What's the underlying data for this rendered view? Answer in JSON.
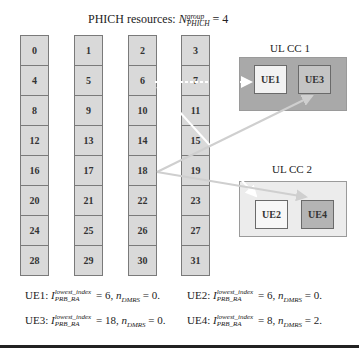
{
  "title": {
    "prefix": "PHICH resources: ",
    "symbol": "N",
    "superscript": "group",
    "subscript": "PHICH",
    "suffix": " = 4"
  },
  "phich_columns": [
    {
      "cells": [
        "0",
        "4",
        "8",
        "12",
        "16",
        "20",
        "24",
        "28"
      ]
    },
    {
      "cells": [
        "1",
        "5",
        "9",
        "13",
        "17",
        "21",
        "25",
        "29"
      ]
    },
    {
      "cells": [
        "2",
        "6",
        "10",
        "14",
        "18",
        "22",
        "26",
        "30"
      ]
    },
    {
      "cells": [
        "3",
        "7",
        "11",
        "15",
        "19",
        "23",
        "27",
        "31"
      ]
    }
  ],
  "carriers": [
    {
      "label": "UL CC 1",
      "ues": [
        {
          "name": "UE1",
          "fill": "#f2f2f2"
        },
        {
          "name": "UE3",
          "fill": "#c4c4c4"
        }
      ],
      "fill": "#a9a9a9"
    },
    {
      "label": "UL CC 2",
      "ues": [
        {
          "name": "UE2",
          "fill": "#f7f7f7"
        },
        {
          "name": "UE4",
          "fill": "#b4b4b4"
        }
      ],
      "fill": "#ececec"
    }
  ],
  "mappings": [
    {
      "from": "6",
      "to": "UE1",
      "color": "#ffffff"
    },
    {
      "from": "6",
      "to": "UE2",
      "color": "#ffffff"
    },
    {
      "from": "18",
      "to": "UE3",
      "color": "#cfcfcf"
    },
    {
      "from": "18",
      "to": "UE4",
      "color": "#cfcfcf"
    }
  ],
  "equations": [
    {
      "ue": "UE1: ",
      "sym": "I",
      "sup": "lowest_index",
      "sub": "PRB_RA",
      "value": " = 6, ",
      "n": "n",
      "nsub": "DMRS",
      "nval": " = 0."
    },
    {
      "ue": "UE2: ",
      "sym": "I",
      "sup": "lowest_index",
      "sub": "PRB_RA",
      "value": " = 6, ",
      "n": "n",
      "nsub": "DMRS",
      "nval": " = 0."
    },
    {
      "ue": "UE3: ",
      "sym": "I",
      "sup": "lowest_index",
      "sub": "PRB_RA",
      "value": " = 18, ",
      "n": "n",
      "nsub": "DMRS",
      "nval": " = 0."
    },
    {
      "ue": "UE4: ",
      "sym": "I",
      "sup": "lowest_index",
      "sub": "PRB_RA",
      "value": " = 8, ",
      "n": "n",
      "nsub": "DMRS",
      "nval": " = 2."
    }
  ]
}
